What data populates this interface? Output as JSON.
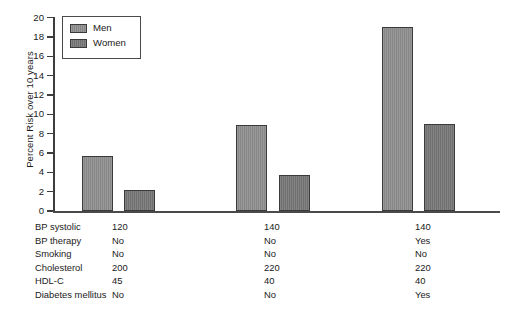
{
  "chart_data": {
    "type": "bar",
    "title": "",
    "xlabel": "",
    "ylabel": "Percent Risk over 10 years",
    "ylim": [
      0,
      20
    ],
    "ytick_step": 2,
    "yticks": [
      20,
      18,
      16,
      14,
      12,
      10,
      8,
      6,
      4,
      2,
      0
    ],
    "grid": false,
    "legend_position": "upper left",
    "categories": [
      "Scenario 1",
      "Scenario 2",
      "Scenario 3"
    ],
    "series": [
      {
        "name": "Men",
        "values": [
          5.7,
          8.9,
          19.0
        ],
        "color": "#8d8d8d"
      },
      {
        "name": "Women",
        "values": [
          2.2,
          3.7,
          9.0
        ],
        "color": "#757575"
      }
    ],
    "risk_factor_table": {
      "rows": [
        {
          "label": "BP systolic",
          "values": [
            "120",
            "140",
            "140"
          ]
        },
        {
          "label": "BP therapy",
          "values": [
            "No",
            "No",
            "Yes"
          ]
        },
        {
          "label": "Smoking",
          "values": [
            "No",
            "No",
            "No"
          ]
        },
        {
          "label": "Cholesterol",
          "values": [
            "200",
            "220",
            "220"
          ]
        },
        {
          "label": "HDL-C",
          "values": [
            "45",
            "40",
            "40"
          ]
        },
        {
          "label": "Diabetes mellitus",
          "values": [
            "No",
            "No",
            "Yes"
          ]
        }
      ]
    }
  },
  "colors": {
    "men": "#8d8d8d",
    "women": "#757575",
    "axis": "#3d3d3d",
    "text": "#1a1a1a",
    "background": "#ffffff"
  }
}
